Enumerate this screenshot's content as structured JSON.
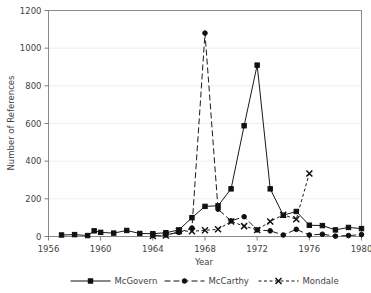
{
  "chart_data": {
    "type": "line",
    "title": "",
    "xlabel": "Year",
    "ylabel": "Number of References",
    "xlim": [
      1956,
      1980
    ],
    "ylim": [
      0,
      1200
    ],
    "xticks": [
      1956,
      1960,
      1964,
      1968,
      1972,
      1976,
      1980
    ],
    "yticks": [
      0,
      200,
      400,
      600,
      800,
      1000,
      1200
    ],
    "xtick_labels": [
      "1956",
      "1960",
      "1964",
      "1968",
      "1972",
      "1976",
      "1980"
    ],
    "ytick_labels": [
      "0",
      "200",
      "400",
      "600",
      "800",
      "1000",
      "1200"
    ],
    "grid": "horizontal",
    "legend_position": "bottom",
    "series": [
      {
        "name": "McGovern",
        "marker": "square",
        "line_style": "solid",
        "color": "#101010",
        "x": [
          1957,
          1958,
          1959,
          1959.5,
          1960,
          1961,
          1962,
          1963,
          1964,
          1965,
          1966,
          1967,
          1968,
          1969,
          1970,
          1971,
          1972,
          1973,
          1974,
          1975,
          1976,
          1977,
          1978,
          1979,
          1980
        ],
        "y": [
          8,
          10,
          5,
          30,
          22,
          18,
          32,
          16,
          15,
          20,
          35,
          100,
          160,
          163,
          253,
          588,
          910,
          253,
          113,
          133,
          60,
          58,
          35,
          48,
          42
        ]
      },
      {
        "name": "McCarthy",
        "marker": "circle",
        "line_style": "long-dash",
        "color": "#101010",
        "x": [
          1964,
          1965,
          1966,
          1967,
          1968,
          1969,
          1970,
          1971,
          1972,
          1973,
          1974,
          1975,
          1976,
          1977,
          1978,
          1979,
          1980
        ],
        "y": [
          5,
          8,
          22,
          45,
          1080,
          145,
          83,
          105,
          35,
          30,
          8,
          38,
          8,
          12,
          2,
          5,
          10
        ]
      },
      {
        "name": "Mondale",
        "marker": "x",
        "line_style": "short-dash",
        "color": "#101010",
        "x": [
          1964,
          1965,
          1966,
          1967,
          1968,
          1969,
          1970,
          1971,
          1972,
          1973,
          1974,
          1975,
          1976
        ],
        "y": [
          3,
          5,
          30,
          28,
          33,
          38,
          80,
          55,
          35,
          80,
          115,
          92,
          335
        ]
      }
    ]
  },
  "legend": {
    "items": [
      {
        "label": "McGovern",
        "marker": "square",
        "line_style": "solid"
      },
      {
        "label": "McCarthy",
        "marker": "circle",
        "line_style": "long-dash"
      },
      {
        "label": "Mondale",
        "marker": "x",
        "line_style": "short-dash"
      }
    ]
  },
  "axes": {
    "x_title": "Year",
    "y_title": "Number of References"
  }
}
